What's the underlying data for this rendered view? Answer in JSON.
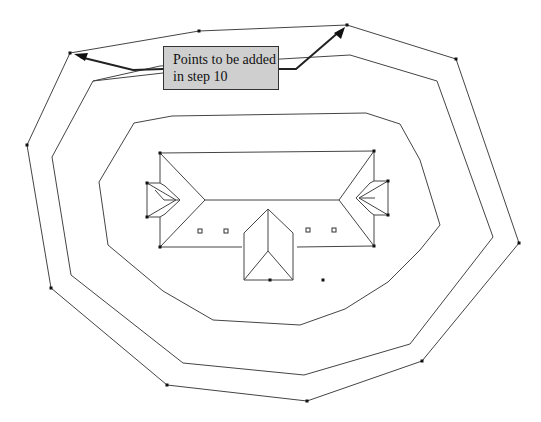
{
  "callout": {
    "line1": "Points to be added",
    "line2": "in step 10"
  },
  "colors": {
    "line": "#444444",
    "vertex": "#111111",
    "callout_fill": "#cfcfcf",
    "callout_border": "#333333"
  },
  "contours": {
    "outer": [
      [
        70,
        53
      ],
      [
        199,
        31
      ],
      [
        347,
        25
      ],
      [
        456,
        59
      ],
      [
        519,
        243
      ],
      [
        422,
        361
      ],
      [
        307,
        401
      ],
      [
        167,
        385
      ],
      [
        51,
        288
      ],
      [
        27,
        145
      ]
    ],
    "middle": [
      [
        93,
        81
      ],
      [
        160,
        66
      ],
      [
        350,
        55
      ],
      [
        437,
        81
      ],
      [
        493,
        237
      ],
      [
        410,
        344
      ],
      [
        304,
        375
      ],
      [
        183,
        363
      ],
      [
        71,
        275
      ],
      [
        52,
        157
      ]
    ],
    "inner": [
      [
        134,
        123
      ],
      [
        172,
        116
      ],
      [
        366,
        113
      ],
      [
        400,
        124
      ],
      [
        420,
        160
      ],
      [
        440,
        225
      ],
      [
        420,
        250
      ],
      [
        388,
        282
      ],
      [
        345,
        309
      ],
      [
        300,
        325
      ],
      [
        213,
        320
      ],
      [
        163,
        291
      ],
      [
        108,
        245
      ],
      [
        99,
        182
      ]
    ]
  },
  "outer_vertex_points": [
    [
      70,
      53
    ],
    [
      199,
      31
    ],
    [
      347,
      25
    ],
    [
      456,
      59
    ],
    [
      519,
      243
    ],
    [
      422,
      361
    ],
    [
      307,
      401
    ],
    [
      167,
      385
    ],
    [
      51,
      288
    ],
    [
      27,
      145
    ]
  ],
  "added_points": [
    [
      70,
      53
    ],
    [
      347,
      25
    ]
  ],
  "house": {
    "vertices": [
      [
        160,
        153
      ],
      [
        374,
        151
      ],
      [
        160,
        247
      ],
      [
        374,
        246
      ],
      [
        147,
        183
      ],
      [
        147,
        217
      ],
      [
        388,
        181
      ],
      [
        388,
        215
      ],
      [
        270,
        280
      ],
      [
        323,
        280
      ]
    ],
    "vents": [
      [
        200,
        231
      ],
      [
        226,
        231
      ],
      [
        308,
        230
      ],
      [
        334,
        230
      ]
    ]
  }
}
